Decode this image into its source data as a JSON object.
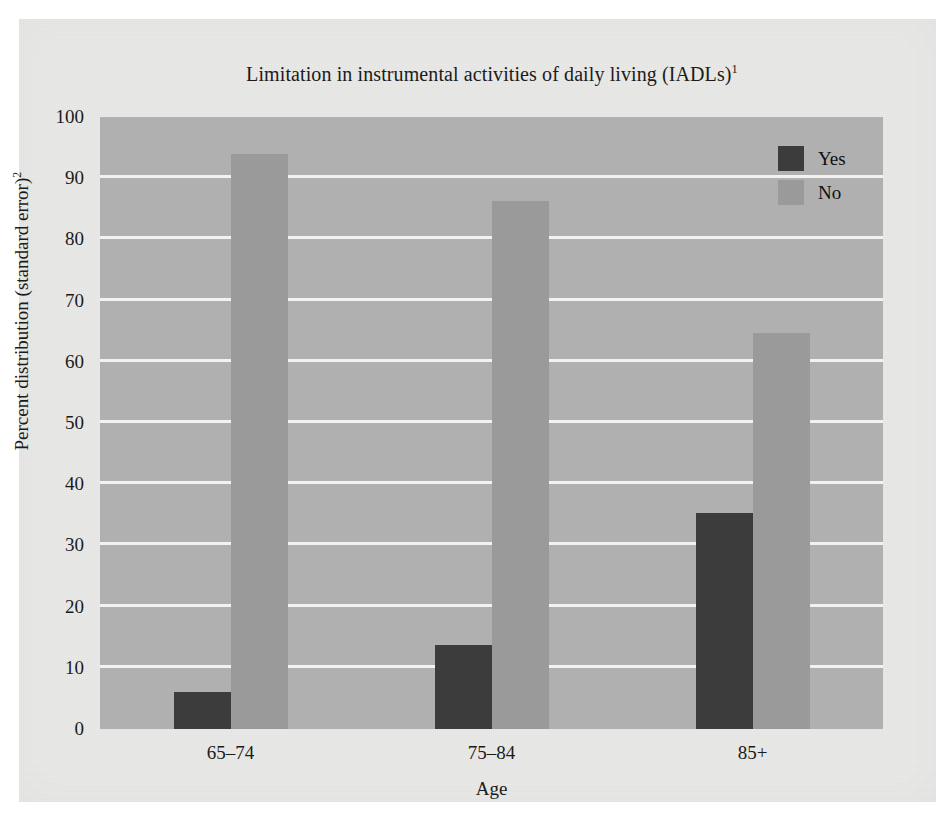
{
  "chart_data": {
    "type": "bar",
    "title": "Limitation in instrumental activities of daily living (IADLs)",
    "title_superscript": "1",
    "xlabel": "Age",
    "ylabel": "Percent distribution (standard error)",
    "ylabel_superscript": "2",
    "categories": [
      "65–74",
      "75–84",
      "85+"
    ],
    "ylim": [
      0,
      100
    ],
    "yticks": [
      0,
      10,
      20,
      30,
      40,
      50,
      60,
      70,
      80,
      90,
      100
    ],
    "grid": true,
    "legend_position": "top-right",
    "series": [
      {
        "name": "Yes",
        "color": "#3c3c3c",
        "values": [
          6.0,
          13.8,
          35.3
        ]
      },
      {
        "name": "No",
        "color": "#9a9a9a",
        "values": [
          94.0,
          86.3,
          64.7
        ]
      }
    ]
  },
  "colors": {
    "page_background": "#e9e9e7",
    "plot_background": "#b0b0b0",
    "gridline": "#f2f2f0",
    "yes_bar": "#3c3c3c",
    "no_bar": "#9a9a9a",
    "text": "#1b1b1b"
  },
  "legend": {
    "items": [
      {
        "label": "Yes",
        "swatch": "#3c3c3c"
      },
      {
        "label": "No",
        "swatch": "#9a9a9a"
      }
    ]
  },
  "axis": {
    "y_ticks": [
      "100",
      "90",
      "80",
      "70",
      "60",
      "50",
      "40",
      "30",
      "20",
      "10",
      "0"
    ],
    "x_ticks": [
      "65–74",
      "75–84",
      "85+"
    ]
  }
}
